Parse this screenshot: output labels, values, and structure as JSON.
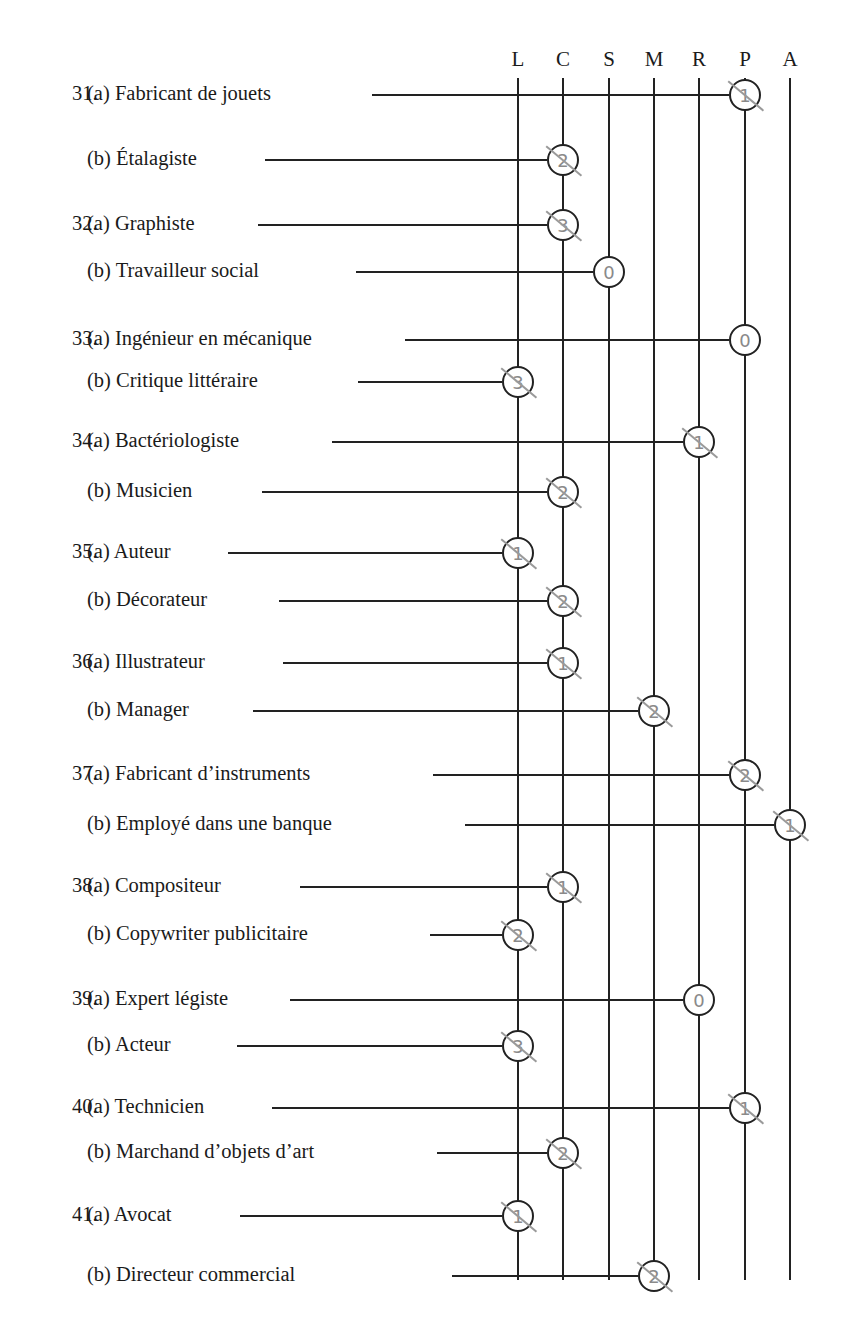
{
  "columns": [
    {
      "key": "L",
      "x": 518
    },
    {
      "key": "C",
      "x": 563
    },
    {
      "key": "S",
      "x": 609
    },
    {
      "key": "M",
      "x": 654
    },
    {
      "key": "R",
      "x": 699
    },
    {
      "key": "P",
      "x": 745
    },
    {
      "key": "A",
      "x": 790
    }
  ],
  "items": [
    {
      "number": "31.",
      "part": "(a)",
      "label": "Fabricant de jouets",
      "column": "P",
      "score": "1",
      "y": 95,
      "line_start": 372
    },
    {
      "number": "",
      "part": "(b)",
      "label": "Étalagiste",
      "column": "C",
      "score": "2",
      "y": 160,
      "line_start": 265
    },
    {
      "number": "32.",
      "part": "(a)",
      "label": "Graphiste",
      "column": "C",
      "score": "3",
      "y": 225,
      "line_start": 258
    },
    {
      "number": "",
      "part": "(b)",
      "label": "Travailleur social",
      "column": "S",
      "score": "0",
      "y": 272,
      "line_start": 356
    },
    {
      "number": "33.",
      "part": "(a)",
      "label": "Ingénieur en mécanique",
      "column": "P",
      "score": "0",
      "y": 340,
      "line_start": 405
    },
    {
      "number": "",
      "part": "(b)",
      "label": "Critique littéraire",
      "column": "L",
      "score": "3",
      "y": 382,
      "line_start": 358
    },
    {
      "number": "34.",
      "part": "(a)",
      "label": "Bactériologiste",
      "column": "R",
      "score": "1",
      "y": 442,
      "line_start": 332
    },
    {
      "number": "",
      "part": "(b)",
      "label": "Musicien",
      "column": "C",
      "score": "2",
      "y": 492,
      "line_start": 262
    },
    {
      "number": "35.",
      "part": "(a)",
      "label": "Auteur",
      "column": "L",
      "score": "1",
      "y": 553,
      "line_start": 228
    },
    {
      "number": "",
      "part": "(b)",
      "label": "Décorateur",
      "column": "C",
      "score": "2",
      "y": 601,
      "line_start": 279
    },
    {
      "number": "36.",
      "part": "(a)",
      "label": "Illustrateur",
      "column": "C",
      "score": "1",
      "y": 663,
      "line_start": 283
    },
    {
      "number": "",
      "part": "(b)",
      "label": "Manager",
      "column": "M",
      "score": "2",
      "y": 711,
      "line_start": 253
    },
    {
      "number": "37.",
      "part": "(a)",
      "label": "Fabricant d’instruments",
      "column": "P",
      "score": "2",
      "y": 775,
      "line_start": 433
    },
    {
      "number": "",
      "part": "(b)",
      "label": "Employé dans une banque",
      "column": "A",
      "score": "1",
      "y": 825,
      "line_start": 465
    },
    {
      "number": "38.",
      "part": "(a)",
      "label": "Compositeur",
      "column": "C",
      "score": "1",
      "y": 887,
      "line_start": 300
    },
    {
      "number": "",
      "part": "(b)",
      "label": "Copywriter publicitaire",
      "column": "L",
      "score": "2",
      "y": 935,
      "line_start": 430
    },
    {
      "number": "39.",
      "part": "(a)",
      "label": "Expert légiste",
      "column": "R",
      "score": "0",
      "y": 1000,
      "line_start": 290
    },
    {
      "number": "",
      "part": "(b)",
      "label": "Acteur",
      "column": "L",
      "score": "3",
      "y": 1046,
      "line_start": 237
    },
    {
      "number": "40.",
      "part": "(a)",
      "label": "Technicien",
      "column": "P",
      "score": "1",
      "y": 1108,
      "line_start": 272
    },
    {
      "number": "",
      "part": "(b)",
      "label": "Marchand d’objets d’art",
      "column": "C",
      "score": "2",
      "y": 1153,
      "line_start": 437
    },
    {
      "number": "41.",
      "part": "(a)",
      "label": "Avocat",
      "column": "L",
      "score": "1",
      "y": 1216,
      "line_start": 240
    },
    {
      "number": "",
      "part": "(b)",
      "label": "Directeur commercial",
      "column": "M",
      "score": "2",
      "y": 1276,
      "line_start": 452
    }
  ]
}
